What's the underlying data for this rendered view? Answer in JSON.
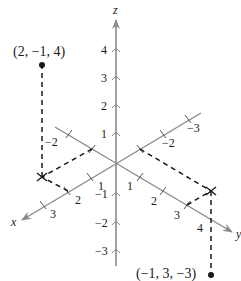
{
  "diagram": {
    "colors": {
      "axis": "#8a8a8a",
      "ink": "#1a1a1a",
      "background": "#ffffff"
    },
    "axes": {
      "x": {
        "label": "x",
        "positive_ticks": [
          "1",
          "2",
          "3"
        ],
        "negative_ticks": [
          "−2",
          "−3"
        ]
      },
      "y": {
        "label": "y",
        "positive_ticks": [
          "1",
          "2",
          "3",
          "4"
        ],
        "negative_ticks": [
          "−2"
        ]
      },
      "z": {
        "label": "z",
        "positive_ticks": [
          "1",
          "2",
          "3",
          "4"
        ],
        "negative_ticks": [
          "−1",
          "−2",
          "−3"
        ]
      }
    },
    "points": [
      {
        "label": "(2, −1, 4)",
        "coords": [
          2,
          -1,
          4
        ]
      },
      {
        "label": "(−1, 3, −3)",
        "coords": [
          -1,
          3,
          -3
        ]
      }
    ]
  }
}
